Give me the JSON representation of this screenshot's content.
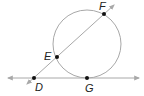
{
  "diagram": {
    "type": "geometry",
    "colors": {
      "stroke": "#a8a8a8",
      "point": "#111111",
      "label": "#222222",
      "arrow": "#a8a8a8"
    },
    "circle": {
      "cx": 87,
      "cy": 44,
      "r": 34
    },
    "tangent_line": {
      "x1": 8,
      "y1": 78,
      "x2": 139,
      "y2": 78
    },
    "secant_line": {
      "x1": 27,
      "y1": 84,
      "x2": 114,
      "y2": 5
    },
    "points": [
      {
        "name": "F",
        "x": 104,
        "y": 14,
        "label": "F",
        "lx": 99,
        "ly": 1
      },
      {
        "name": "E",
        "x": 57,
        "y": 57,
        "label": "E",
        "lx": 44,
        "ly": 51
      },
      {
        "name": "D",
        "x": 34,
        "y": 78,
        "label": "D",
        "lx": 35,
        "ly": 82
      },
      {
        "name": "G",
        "x": 87,
        "y": 78,
        "label": "G",
        "lx": 85,
        "ly": 83
      }
    ]
  }
}
